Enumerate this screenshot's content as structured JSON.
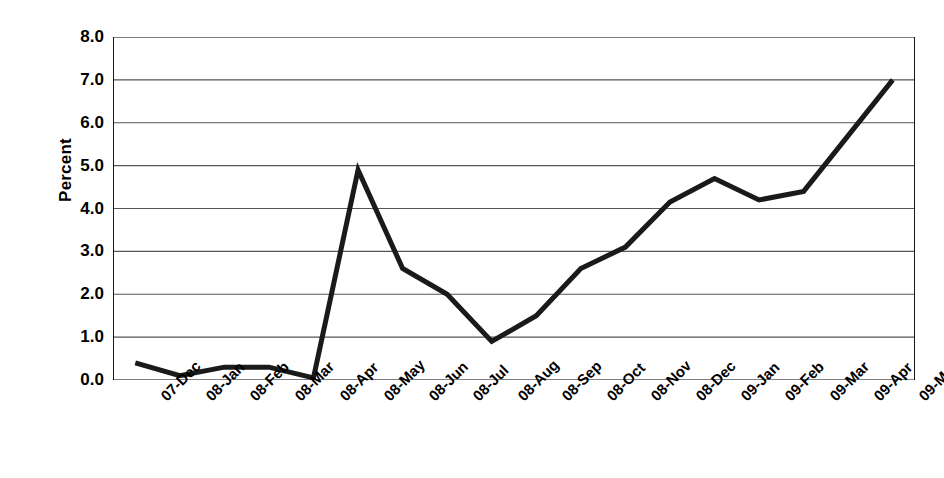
{
  "chart_data": {
    "type": "line",
    "title": "",
    "subtitle": "",
    "xlabel": "",
    "ylabel": "Percent",
    "ylim": [
      0.0,
      8.0
    ],
    "ytick_labels": [
      "8.0",
      "7.0",
      "6.0",
      "5.0",
      "4.0",
      "3.0",
      "2.0",
      "1.0",
      "0.0"
    ],
    "ytick_values": [
      8.0,
      7.0,
      6.0,
      5.0,
      4.0,
      3.0,
      2.0,
      1.0,
      0.0
    ],
    "grid": "horizontal",
    "legend": "none",
    "line_color": "#1a1a1a",
    "axis_color": "#000000",
    "grid_color": "#555555",
    "categories": [
      "07-Dec",
      "08-Jan",
      "08-Feb",
      "08-Mar",
      "08-Apr",
      "08-May",
      "08-Jun",
      "08-Jul",
      "08-Aug",
      "08-Sep",
      "08-Oct",
      "08-Nov",
      "08-Dec",
      "09-Jan",
      "09-Feb",
      "09-Mar",
      "09-Apr",
      "09-May"
    ],
    "series": [
      {
        "name": "Percent",
        "values": [
          0.4,
          0.1,
          0.3,
          0.3,
          0.05,
          4.9,
          2.6,
          2.0,
          0.9,
          1.5,
          2.6,
          3.1,
          4.15,
          4.7,
          4.2,
          4.4,
          5.7,
          7.0
        ]
      }
    ]
  }
}
